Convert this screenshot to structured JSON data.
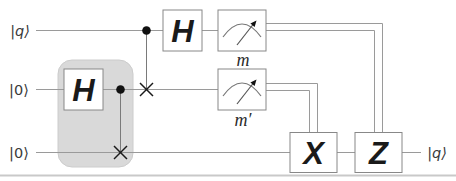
{
  "figure_type": "quantum-circuit-diagram",
  "colors": {
    "background": "#ffffff",
    "quantum_wire": "#9a9a9a",
    "classical_wire": "#9a9a9a",
    "gate_border": "#888888",
    "gate_fill": "#ffffff",
    "ink": "#1a1a1a",
    "highlight_fill": "#d9d9d9",
    "baseline_rule": "#c9c9c9"
  },
  "kets": {
    "input_top": "|q⟩",
    "input_middle": "|0⟩",
    "input_bottom": "|0⟩",
    "output_bottom": "|q⟩"
  },
  "gates": {
    "hadamard_prep": "H",
    "hadamard_top": "H",
    "x_correction": "X",
    "z_correction": "Z"
  },
  "measurements": {
    "top_label": "m",
    "middle_label": "m′",
    "icon": "meter-icon"
  }
}
